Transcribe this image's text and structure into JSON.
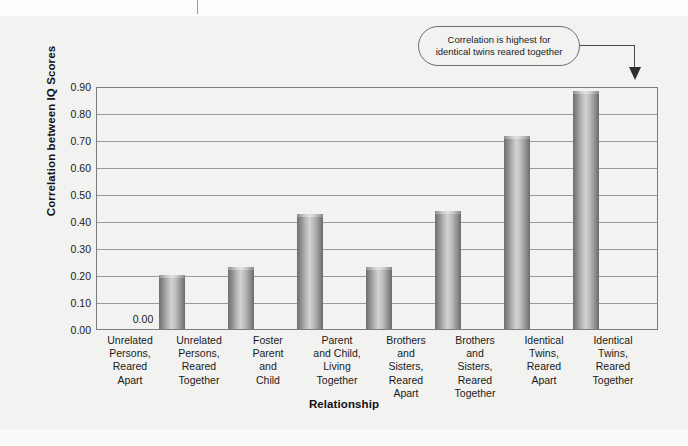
{
  "chart_data": {
    "type": "bar",
    "title": "",
    "xlabel": "Relationship",
    "ylabel": "Correlation between IQ Scores",
    "ylim": [
      0.0,
      0.9
    ],
    "grid": true,
    "legend": null,
    "categories": [
      "Unrelated Persons, Reared Apart",
      "Unrelated Persons, Reared Together",
      "Foster Parent and Child",
      "Parent and Child, Living Together",
      "Brothers and Sisters, Reared Apart",
      "Brothers and Sisters, Reared Together",
      "Identical Twins, Reared Apart",
      "Identical Twins, Reared Together"
    ],
    "category_lines": [
      [
        "Unrelated",
        "Persons,",
        "Reared",
        "Apart"
      ],
      [
        "Unrelated",
        "Persons,",
        "Reared",
        "Together"
      ],
      [
        "Foster",
        "Parent",
        "and",
        "Child"
      ],
      [
        "Parent",
        "and Child,",
        "Living",
        "Together"
      ],
      [
        "Brothers",
        "and",
        "Sisters,",
        "Reared",
        "Apart"
      ],
      [
        "Brothers",
        "and",
        "Sisters,",
        "Reared",
        "Together"
      ],
      [
        "Identical",
        "Twins,",
        "Reared",
        "Apart"
      ],
      [
        "Identical",
        "Twins,",
        "Reared",
        "Together"
      ]
    ],
    "values": [
      0.0,
      0.2,
      0.23,
      0.43,
      0.23,
      0.44,
      0.72,
      0.89
    ],
    "ytick_labels": [
      "0.90",
      "0.80",
      "0.70",
      "0.60",
      "0.50",
      "0.40",
      "0.30",
      "0.20",
      "0.10",
      "0.00"
    ],
    "ytick_values": [
      0.9,
      0.8,
      0.7,
      0.6,
      0.5,
      0.4,
      0.3,
      0.2,
      0.1,
      0.0
    ],
    "data_labels": {
      "0": "0.00"
    },
    "annotations": [
      {
        "text": "Correlation is highest for identical twins reared together",
        "line1": "Correlation is highest for",
        "line2": "identical twins reared together",
        "points_to": "Identical Twins, Reared Together"
      }
    ],
    "colors": {
      "background": "#f2f2f0",
      "bar_dark": "#6f6f6f",
      "bar_light": "#d2d2d2",
      "gridline": "#9b9b9b",
      "frame": "#7b7b7b",
      "text": "#1a1a1a"
    }
  }
}
